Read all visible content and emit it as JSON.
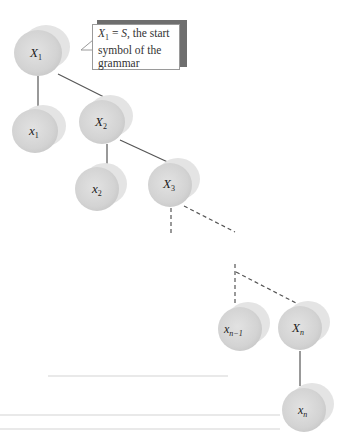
{
  "diagram": {
    "type": "parse-tree",
    "callout": {
      "lhs": "X",
      "lhs_sub": "1",
      "eq": " = ",
      "rhs": "S",
      "text": ", the start symbol of the grammar",
      "full_text": "X1 = S, the start symbol of the grammar"
    },
    "nodes": [
      {
        "id": "X1",
        "label": "X",
        "sub": "1",
        "kind": "nonterminal",
        "cx": 38,
        "cy": 52
      },
      {
        "id": "x1",
        "label": "x",
        "sub": "1",
        "kind": "terminal",
        "cx": 36,
        "cy": 130
      },
      {
        "id": "X2",
        "label": "X",
        "sub": "2",
        "kind": "nonterminal",
        "cx": 102,
        "cy": 120
      },
      {
        "id": "x2",
        "label": "x",
        "sub": "2",
        "kind": "terminal",
        "cx": 97,
        "cy": 188
      },
      {
        "id": "X3",
        "label": "X",
        "sub": "3",
        "kind": "nonterminal",
        "cx": 170,
        "cy": 183
      },
      {
        "id": "xn-1",
        "label": "x",
        "sub": "n−1",
        "kind": "terminal",
        "cx": 240,
        "cy": 328
      },
      {
        "id": "Xn",
        "label": "X",
        "sub": "n",
        "kind": "nonterminal",
        "cx": 300,
        "cy": 327
      },
      {
        "id": "xn",
        "label": "x",
        "sub": "n",
        "kind": "terminal",
        "cx": 305,
        "cy": 410
      }
    ],
    "edges": [
      {
        "from": "X1",
        "to": "x1",
        "style": "solid"
      },
      {
        "from": "X1",
        "to": "X2",
        "style": "solid"
      },
      {
        "from": "X2",
        "to": "x2",
        "style": "solid"
      },
      {
        "from": "X2",
        "to": "X3",
        "style": "solid"
      },
      {
        "from": "X3",
        "to": "...",
        "style": "dashed"
      },
      {
        "from": "...",
        "to": "xn-1",
        "style": "dashed"
      },
      {
        "from": "...",
        "to": "Xn",
        "style": "dashed"
      },
      {
        "from": "Xn",
        "to": "xn",
        "style": "solid"
      }
    ],
    "colors": {
      "node_fill": "#d6d6d6",
      "node_shadow": "#e6e6e6",
      "edge": "#555555",
      "callout_shadow": "#6e6e6e",
      "callout_border": "#9a9a9a"
    }
  }
}
